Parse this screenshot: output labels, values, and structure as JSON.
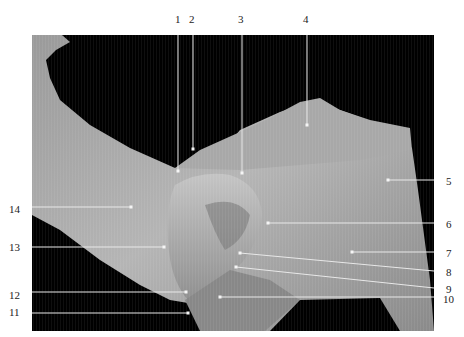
{
  "figure": {
    "background_color": "#ffffff",
    "photo_background": "#000000",
    "label_color": "#222222",
    "line_color": "#e8e8e8"
  },
  "labels": [
    {
      "id": "1",
      "text": "1",
      "side": "top"
    },
    {
      "id": "2",
      "text": "2",
      "side": "top"
    },
    {
      "id": "3",
      "text": "3",
      "side": "top"
    },
    {
      "id": "4",
      "text": "4",
      "side": "top"
    },
    {
      "id": "5",
      "text": "5",
      "side": "right"
    },
    {
      "id": "6",
      "text": "6",
      "side": "right"
    },
    {
      "id": "7",
      "text": "7",
      "side": "right"
    },
    {
      "id": "8",
      "text": "8",
      "side": "right"
    },
    {
      "id": "9",
      "text": "9",
      "side": "right"
    },
    {
      "id": "10",
      "text": "10",
      "side": "right"
    },
    {
      "id": "11",
      "text": "11",
      "side": "left"
    },
    {
      "id": "12",
      "text": "12",
      "side": "left"
    },
    {
      "id": "13",
      "text": "13",
      "side": "left"
    },
    {
      "id": "14",
      "text": "14",
      "side": "left"
    }
  ]
}
